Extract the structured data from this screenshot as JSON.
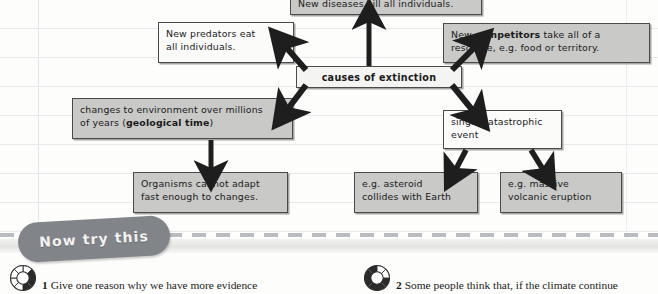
{
  "diagram": {
    "title": "causes of extinction",
    "nodes": [
      {
        "id": "diseases",
        "text": "New diseases kill all individuals.",
        "style": "shaded"
      },
      {
        "id": "predators",
        "text": "New predators eat all individuals.",
        "style": "white"
      },
      {
        "id": "competitors",
        "text": "New competitors take all of a resource, e.g. food or territory.",
        "bold_words": [
          "competitors"
        ],
        "style": "shaded"
      },
      {
        "id": "center",
        "text": "causes of extinction",
        "style": "light"
      },
      {
        "id": "changes",
        "text": "changes to environment over millions of years (geological time)",
        "bold_words": [
          "geological time"
        ],
        "style": "shaded"
      },
      {
        "id": "single",
        "text": "single catastrophic event",
        "style": "white"
      },
      {
        "id": "organisms",
        "text": "Organisms cannot adapt fast enough to changes.",
        "style": "shaded"
      },
      {
        "id": "asteroid",
        "text": "e.g. asteroid collides with Earth",
        "style": "shaded"
      },
      {
        "id": "volcanic",
        "text": "e.g. massive volcanic eruption",
        "style": "shaded"
      }
    ],
    "node_text": {
      "diseases": "New diseases kill all individuals.",
      "predators_line1": "New predators eat",
      "predators_line2": "all individuals.",
      "competitors_pre": "New ",
      "competitors_bold": "competitors",
      "competitors_post": " take all of a",
      "competitors_line2": "resource, e.g. food or territory.",
      "center": "causes of extinction",
      "changes_line1": "changes to environment over millions",
      "changes_pre2": "of years (",
      "changes_bold": "geological time",
      "changes_post2": ")",
      "single_line1": "single catastrophic",
      "single_line2": "event",
      "organisms_line1": "Organisms cannot adapt",
      "organisms_line2": "fast enough to changes.",
      "asteroid_line1": "e.g. asteroid",
      "asteroid_line2": "collides with Earth",
      "volcanic_line1": "e.g. massive",
      "volcanic_line2": "volcanic eruption"
    },
    "colors": {
      "shaded_fill": "#c9c9c7",
      "light_fill": "#f4f4f2",
      "white_fill": "#fbfbfa",
      "border": "#4a4a4a",
      "arrow": "#1e1e1e"
    }
  },
  "banner": {
    "label": "Now try this",
    "pill_color": "#818488",
    "text_color": "#f3f3f1"
  },
  "questions": [
    {
      "number": "1",
      "text": "Give one reason why we have more evidence",
      "icon": "progress-ring-icon"
    },
    {
      "number": "2",
      "text": "Some people think that, if the climate continue",
      "icon": "progress-ring-icon"
    }
  ]
}
